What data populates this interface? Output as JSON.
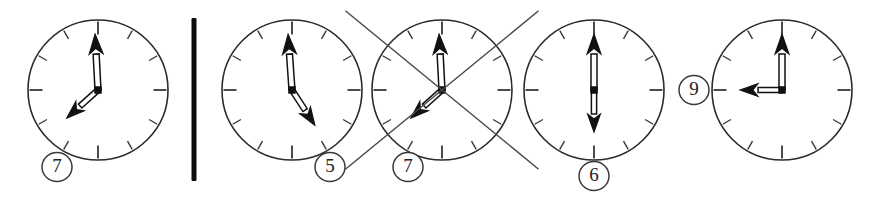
{
  "figure": {
    "kind": "analog-clock-row",
    "background_color": "#ffffff",
    "ink_color": "#2b2b2b",
    "strike_color": "#4a4a4a",
    "divider": {
      "present": true,
      "label": "vertical separator bar",
      "x": 194,
      "y_top": 18,
      "y_bottom": 181,
      "thickness": 5,
      "color": "#0d0d0d"
    },
    "clocks": [
      {
        "id": "clock-1",
        "badge": "7",
        "badge_position": "bottom-left",
        "cx": 98,
        "cy": 90,
        "r": 70,
        "badge_cx": 57,
        "badge_cy": 167,
        "minute_hand_deg": 357,
        "hour_hand_deg": 228,
        "struck_out": false,
        "reading": "7 o'clock"
      },
      {
        "id": "clock-2",
        "badge": "5",
        "badge_position": "bottom-right",
        "cx": 292,
        "cy": 90,
        "r": 70,
        "badge_cx": 330,
        "badge_cy": 167,
        "minute_hand_deg": 356,
        "hour_hand_deg": 147,
        "struck_out": false,
        "reading": "5 o'clock"
      },
      {
        "id": "clock-3",
        "badge": "7",
        "badge_position": "bottom-left",
        "cx": 442,
        "cy": 90,
        "r": 70,
        "badge_cx": 408,
        "badge_cy": 167,
        "minute_hand_deg": 357,
        "hour_hand_deg": 228,
        "struck_out": true,
        "reading": "7 o'clock"
      },
      {
        "id": "clock-4",
        "badge": "6",
        "badge_position": "bottom-center",
        "cx": 594,
        "cy": 90,
        "r": 70,
        "badge_cx": 594,
        "badge_cy": 176,
        "minute_hand_deg": 0,
        "hour_hand_deg": 180,
        "struck_out": false,
        "reading": "6 o'clock"
      },
      {
        "id": "clock-5",
        "badge": "9",
        "badge_position": "left",
        "cx": 782,
        "cy": 90,
        "r": 70,
        "badge_cx": 694,
        "badge_cy": 90,
        "minute_hand_deg": 0,
        "hour_hand_deg": 270,
        "struck_out": false,
        "reading": "9 o'clock"
      }
    ],
    "badge_labels": [
      "7",
      "5",
      "7",
      "6",
      "9"
    ],
    "icons": {
      "divider": "vertical-bar-icon",
      "strike": "cross-out-icon",
      "clock": "clock-face-icon",
      "badge": "circled-number-icon"
    }
  }
}
